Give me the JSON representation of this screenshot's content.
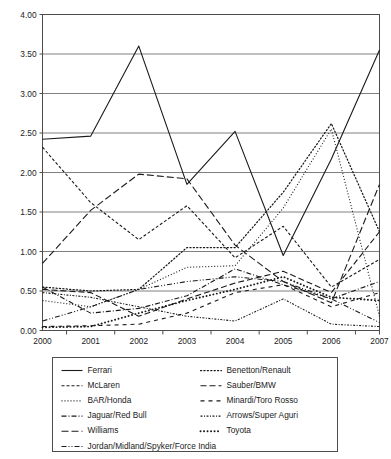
{
  "chart_data": {
    "type": "line",
    "title": "",
    "xlabel": "",
    "ylabel": "",
    "x": [
      "2000",
      "2001",
      "2002",
      "2003",
      "2004",
      "2005",
      "2006",
      "2007"
    ],
    "categories": [
      "2000",
      "2001",
      "2002",
      "2003",
      "2004",
      "2005",
      "2006",
      "2007"
    ],
    "ylim": [
      0.0,
      4.0
    ],
    "ytick_labels": [
      "0.00",
      "0.50",
      "1.00",
      "1.50",
      "2.00",
      "2.50",
      "3.00",
      "3.50",
      "4.00"
    ],
    "ytick_values": [
      0.0,
      0.5,
      1.0,
      1.5,
      2.0,
      2.5,
      3.0,
      3.5,
      4.0
    ],
    "grid": true,
    "legend_position": "bottom",
    "series": [
      {
        "name": "Ferrari",
        "dash": "solid",
        "values": [
          2.42,
          2.46,
          3.6,
          1.85,
          2.52,
          0.95,
          2.17,
          3.55
        ]
      },
      {
        "name": "McLaren",
        "dash": "short-dash",
        "values": [
          2.32,
          1.62,
          1.15,
          1.58,
          0.92,
          1.32,
          0.55,
          0.9
        ]
      },
      {
        "name": "BAR/Honda",
        "dash": "fine-dot",
        "values": [
          0.38,
          0.3,
          0.52,
          0.8,
          0.82,
          1.55,
          2.55,
          0.18
        ]
      },
      {
        "name": "Jaguar/Red Bull",
        "dash": "dash-dot",
        "values": [
          0.55,
          0.22,
          0.28,
          0.44,
          0.78,
          0.58,
          0.4,
          0.62
        ]
      },
      {
        "name": "Williams",
        "dash": "long-dash",
        "values": [
          0.85,
          1.52,
          1.98,
          1.92,
          1.08,
          0.62,
          0.35,
          1.85
        ]
      },
      {
        "name": "Jordan/Midland/Spyker/Force India",
        "dash": "dash-dot-dot",
        "values": [
          0.12,
          0.3,
          0.52,
          0.62,
          0.68,
          0.62,
          0.4,
          0.1
        ]
      },
      {
        "name": "Benetton/Renault",
        "dash": "dot",
        "values": [
          0.55,
          0.5,
          0.52,
          1.05,
          1.05,
          1.75,
          2.62,
          1.25
        ]
      },
      {
        "name": "Sauber/BMW",
        "dash": "medium-dash",
        "values": [
          0.52,
          0.48,
          0.18,
          0.4,
          0.6,
          0.75,
          0.48,
          1.25
        ]
      },
      {
        "name": "Minardi/Toro Rosso",
        "dash": "sparse-dash",
        "values": [
          0.05,
          0.06,
          0.08,
          0.22,
          0.48,
          0.58,
          0.3,
          0.48
        ]
      },
      {
        "name": "Arrows/Super Aguri",
        "dash": "fine-dash-dot",
        "values": [
          0.48,
          0.42,
          0.3,
          0.18,
          0.12,
          0.4,
          0.08,
          0.05
        ]
      },
      {
        "name": "Toyota",
        "dash": "round-dot",
        "values": [
          0.04,
          0.05,
          0.22,
          0.38,
          0.52,
          0.68,
          0.42,
          0.38
        ]
      }
    ]
  },
  "axes": {
    "y_labels": [
      "4.00",
      "3.50",
      "3.00",
      "2.50",
      "2.00",
      "1.50",
      "1.00",
      "0.50",
      "0.00"
    ],
    "x_labels": [
      "2000",
      "2001",
      "2002",
      "2003",
      "2004",
      "2005",
      "2006",
      "2007"
    ]
  },
  "legend": {
    "column_left": [
      "Ferrari",
      "McLaren",
      "BAR/Honda",
      "Jaguar/Red Bull",
      "Williams",
      "Jordan/Midland/Spyker/Force India"
    ],
    "column_right": [
      "Benetton/Renault",
      "Sauber/BMW",
      "Minardi/Toro Rosso",
      "Arrows/Super Aguri",
      "Toyota"
    ]
  },
  "colors": {
    "line": "#1a1a1a",
    "grid": "#808080",
    "frame": "#4d4d4d",
    "background": "#ffffff",
    "text": "#1a1a1a"
  }
}
